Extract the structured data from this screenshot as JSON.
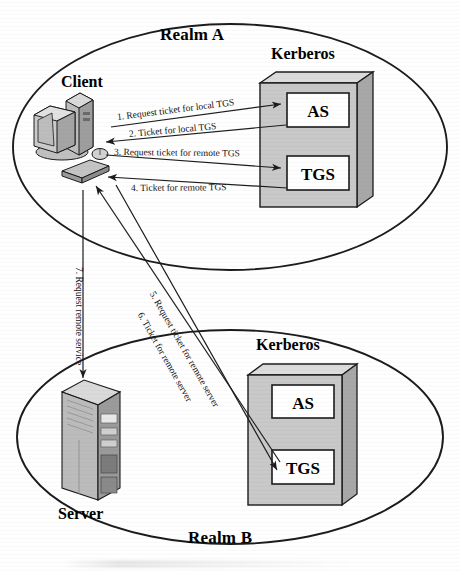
{
  "figure": {
    "type": "diagram"
  },
  "realms": [
    {
      "id": "realm-a",
      "label": "Realm A",
      "kerberos_label": "Kerberos",
      "principal_label": "Client",
      "services": [
        {
          "id": "as",
          "label": "AS"
        },
        {
          "id": "tgs",
          "label": "TGS"
        }
      ]
    },
    {
      "id": "realm-b",
      "label": "Realm B",
      "kerberos_label": "Kerberos",
      "principal_label": "Server",
      "services": [
        {
          "id": "as",
          "label": "AS"
        },
        {
          "id": "tgs",
          "label": "TGS"
        }
      ]
    }
  ],
  "flows": [
    {
      "num": "1",
      "label": "1. Request ticket for local TGS",
      "direction": "client-to-as"
    },
    {
      "num": "2",
      "label": "2. Ticket for local TGS",
      "direction": "as-to-client"
    },
    {
      "num": "3",
      "label": "3. Request ticket for remote TGS",
      "direction": "client-to-tgs"
    },
    {
      "num": "4",
      "label": "4. Ticket for remote TGS",
      "direction": "tgs-to-client"
    },
    {
      "num": "5",
      "label": "5. Request ticket for remote server",
      "direction": "client-to-remote-tgs"
    },
    {
      "num": "6",
      "label": "6. Ticket for remote server",
      "direction": "remote-tgs-to-client"
    },
    {
      "num": "7",
      "label": "7. Request remote service",
      "direction": "client-to-server"
    }
  ],
  "colors": {
    "stroke": "#1c1c1c",
    "box_face": "#c9c9c9",
    "box_top": "#dcdcdc",
    "box_side": "#a8a8a8",
    "inner_box": "#ffffff",
    "device_light": "#d6d6d6",
    "device_mid": "#b4b4b4",
    "device_dark": "#8e8e8e",
    "background": "#ffffff"
  }
}
